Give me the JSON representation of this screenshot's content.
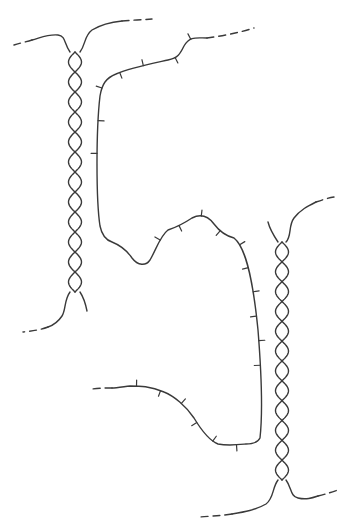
{
  "figure": {
    "stroke_color": "#3a3a3a",
    "background_color": "#ffffff",
    "elements": [
      {
        "name": "left-double-helix",
        "kind": "double helix",
        "turns": 6
      },
      {
        "name": "right-double-helix",
        "kind": "double helix",
        "turns": 6
      },
      {
        "name": "single-strand-loop",
        "kind": "single strand with bases"
      },
      {
        "name": "dashed-continuations",
        "kind": "dashed strand ends",
        "count": 6
      }
    ],
    "labels": []
  }
}
